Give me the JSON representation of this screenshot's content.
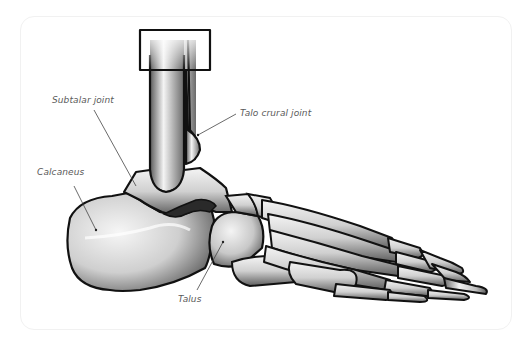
{
  "diagram": {
    "labels": {
      "subtalar_joint": "Subtalar joint",
      "talo_crural_joint": "Talo crural joint",
      "calcaneus": "Calcaneus",
      "talus": "Talus"
    },
    "colors": {
      "outline": "#111111",
      "bone_light": "#f2f2f2",
      "bone_mid": "#bdbdbd",
      "bone_dark": "#6a6a6a",
      "leader_line": "#444444",
      "label_text": "#5a5a5a",
      "card_border": "#f1f1f1"
    }
  }
}
